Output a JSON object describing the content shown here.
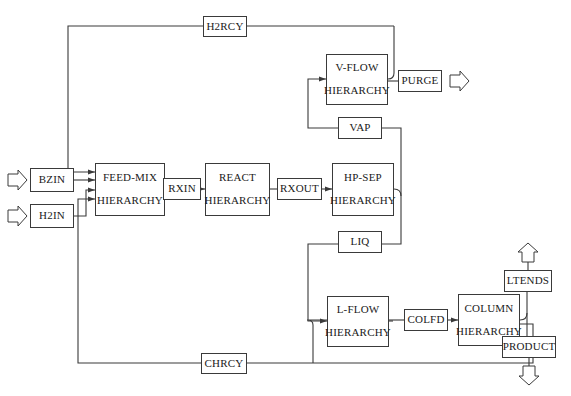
{
  "diagram": {
    "background_color": "#ffffff",
    "line_color": "#3a3a3a",
    "text_color": "#1a1a1a",
    "caption": "",
    "blocks": [
      {
        "id": "bzin",
        "label": "BZIN",
        "sublabel": "",
        "type": "stream",
        "x": 30,
        "y": 168,
        "w": 44,
        "h": 24
      },
      {
        "id": "h2in",
        "label": "H2IN",
        "sublabel": "",
        "type": "stream",
        "x": 30,
        "y": 204,
        "w": 44,
        "h": 24
      },
      {
        "id": "feedmix",
        "label": "FEED-MIX",
        "sublabel": "HIERARCHY",
        "type": "hierarchy",
        "x": 95,
        "y": 163,
        "w": 70,
        "h": 53
      },
      {
        "id": "rxin",
        "label": "RXIN",
        "sublabel": "",
        "type": "stream",
        "x": 163,
        "y": 178,
        "w": 38,
        "h": 22
      },
      {
        "id": "react",
        "label": "REACT",
        "sublabel": "HIERARCHY",
        "type": "hierarchy",
        "x": 205,
        "y": 163,
        "w": 65,
        "h": 53
      },
      {
        "id": "rxout",
        "label": "RXOUT",
        "sublabel": "",
        "type": "stream",
        "x": 277,
        "y": 178,
        "w": 45,
        "h": 22
      },
      {
        "id": "hpsep",
        "label": "HP-SEP",
        "sublabel": "HIERARCHY",
        "type": "hierarchy",
        "x": 332,
        "y": 163,
        "w": 62,
        "h": 53
      },
      {
        "id": "vflow",
        "label": "V-FLOW",
        "sublabel": "HIERARCHY",
        "type": "hierarchy",
        "x": 326,
        "y": 54,
        "w": 62,
        "h": 51
      },
      {
        "id": "purge",
        "label": "PURGE",
        "sublabel": "",
        "type": "stream",
        "x": 398,
        "y": 70,
        "w": 44,
        "h": 22
      },
      {
        "id": "vap",
        "label": "VAP",
        "sublabel": "",
        "type": "stream",
        "x": 338,
        "y": 117,
        "w": 44,
        "h": 22
      },
      {
        "id": "liq",
        "label": "LIQ",
        "sublabel": "",
        "type": "stream",
        "x": 338,
        "y": 231,
        "w": 44,
        "h": 22
      },
      {
        "id": "lflow",
        "label": "L-FLOW",
        "sublabel": "HIERARCHY",
        "type": "hierarchy",
        "x": 327,
        "y": 296,
        "w": 62,
        "h": 51
      },
      {
        "id": "colfd",
        "label": "COLFD",
        "sublabel": "",
        "type": "stream",
        "x": 404,
        "y": 309,
        "w": 44,
        "h": 22
      },
      {
        "id": "column",
        "label": "COLUMN",
        "sublabel": "HIERARCHY",
        "type": "hierarchy",
        "x": 458,
        "y": 294,
        "w": 62,
        "h": 52
      },
      {
        "id": "ltends",
        "label": "LTENDS",
        "sublabel": "",
        "type": "stream",
        "x": 504,
        "y": 270,
        "w": 48,
        "h": 22
      },
      {
        "id": "product",
        "label": "PRODUCT",
        "sublabel": "",
        "type": "stream",
        "x": 502,
        "y": 336,
        "w": 54,
        "h": 22
      },
      {
        "id": "h2rcy",
        "label": "H2RCY",
        "sublabel": "",
        "type": "stream",
        "x": 203,
        "y": 16,
        "w": 44,
        "h": 21
      },
      {
        "id": "chrcy",
        "label": "CHRCY",
        "sublabel": "",
        "type": "stream",
        "x": 201,
        "y": 353,
        "w": 46,
        "h": 21
      }
    ],
    "connections": [
      {
        "from": "inlet-arrow",
        "to": "bzin",
        "label": "benzene feed inlet"
      },
      {
        "from": "inlet-arrow",
        "to": "h2in",
        "label": "hydrogen feed inlet"
      },
      {
        "from": "bzin",
        "to": "feedmix",
        "label": ""
      },
      {
        "from": "h2in",
        "to": "feedmix",
        "label": ""
      },
      {
        "from": "h2rcy",
        "to": "feedmix",
        "label": "hydrogen recycle"
      },
      {
        "from": "chrcy",
        "to": "feedmix",
        "label": "cyclohexane recycle"
      },
      {
        "from": "feedmix",
        "to": "rxin",
        "label": ""
      },
      {
        "from": "rxin",
        "to": "react",
        "label": ""
      },
      {
        "from": "react",
        "to": "rxout",
        "label": ""
      },
      {
        "from": "rxout",
        "to": "hpsep",
        "label": ""
      },
      {
        "from": "hpsep",
        "to": "vap",
        "label": "vapour"
      },
      {
        "from": "hpsep",
        "to": "liq",
        "label": "liquid"
      },
      {
        "from": "vap",
        "to": "vflow",
        "label": ""
      },
      {
        "from": "vflow",
        "to": "purge",
        "label": ""
      },
      {
        "from": "vflow",
        "to": "h2rcy",
        "label": ""
      },
      {
        "from": "purge",
        "to": "outlet-arrow",
        "label": "purge outlet"
      },
      {
        "from": "liq",
        "to": "lflow",
        "label": ""
      },
      {
        "from": "lflow",
        "to": "colfd",
        "label": ""
      },
      {
        "from": "colfd",
        "to": "column",
        "label": ""
      },
      {
        "from": "column",
        "to": "ltends",
        "label": ""
      },
      {
        "from": "column",
        "to": "product",
        "label": ""
      },
      {
        "from": "ltends",
        "to": "outlet-arrow",
        "label": "light ends outlet"
      },
      {
        "from": "product",
        "to": "outlet-arrow",
        "label": "product outlet"
      },
      {
        "from": "column",
        "to": "chrcy",
        "label": ""
      },
      {
        "from": "chrcy",
        "to": "lflow",
        "label": ""
      }
    ],
    "icons": {
      "inlet_arrow": "open-arrow-right",
      "outlet_arrow_up": "open-arrow-up",
      "outlet_arrow_down": "open-arrow-down",
      "outlet_arrow_right": "open-arrow-right"
    }
  }
}
